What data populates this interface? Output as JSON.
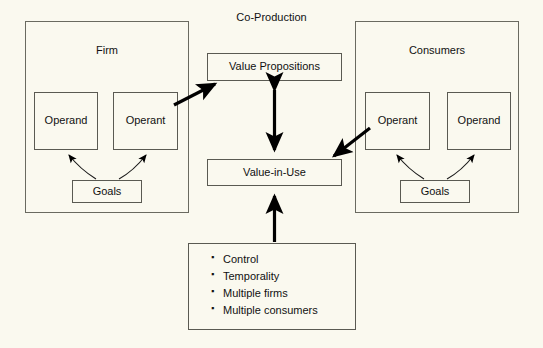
{
  "diagram": {
    "title": "Co-Production",
    "groups": [
      {
        "id": "firm",
        "label": "Firm"
      },
      {
        "id": "consumers",
        "label": "Consumers"
      }
    ],
    "firm": {
      "label": "Firm",
      "resources": [
        {
          "id": "firm-operand",
          "label": "Operand"
        },
        {
          "id": "firm-operant",
          "label": "Operant"
        }
      ],
      "goals_label": "Goals"
    },
    "consumers": {
      "label": "Consumers",
      "resources": [
        {
          "id": "consumer-operant",
          "label": "Operant"
        },
        {
          "id": "consumer-operand",
          "label": "Operand"
        }
      ],
      "goals_label": "Goals"
    },
    "center": {
      "value_propositions": "Value Propositions",
      "value_in_use": "Value-in-Use"
    },
    "factors": {
      "items": [
        "Control",
        "Temporality",
        "Multiple firms",
        "Multiple consumers"
      ]
    },
    "colors": {
      "background": "#faf9ef",
      "border": "#5a5a52",
      "group_border": "#6a6a60",
      "text": "#111111",
      "arrow": "#000000"
    },
    "icons": {
      "bullet": "square-bullet-icon",
      "arrow_bidirectional": "double-arrow-icon",
      "arrow_curved": "curved-arrow-icon"
    }
  }
}
